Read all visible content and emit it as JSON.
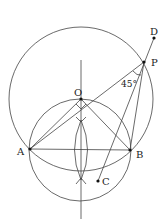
{
  "diagram": {
    "points": {
      "O": {
        "label": "O",
        "x": 81,
        "y": 99
      },
      "A": {
        "label": "A",
        "x": 30,
        "y": 149
      },
      "B": {
        "label": "B",
        "x": 130,
        "y": 150
      },
      "P": {
        "label": "P",
        "x": 144,
        "y": 62
      },
      "D": {
        "label": "D",
        "x": 154,
        "y": 38
      },
      "C": {
        "label": "C",
        "x": 98,
        "y": 181
      }
    },
    "angle_label": "45°",
    "colors": {
      "line": "#444444",
      "point": "#111111"
    }
  }
}
